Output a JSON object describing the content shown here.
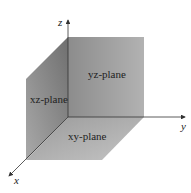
{
  "diagram": {
    "type": "3d-coordinate-planes",
    "axes": {
      "x": {
        "label": "x"
      },
      "y": {
        "label": "y"
      },
      "z": {
        "label": "z"
      }
    },
    "planes": [
      {
        "id": "yz",
        "label": "yz-plane"
      },
      {
        "id": "xz",
        "label": "xz-plane"
      },
      {
        "id": "xy",
        "label": "xy-plane"
      }
    ],
    "colors": {
      "axis": "#333333",
      "yz_plane_start": "#8a8a8a",
      "yz_plane_end": "#b0b0b0",
      "xz_plane_start": "#7a7a7a",
      "xz_plane_end": "#a8a8a8",
      "xy_plane_start": "#a0a0a0",
      "xy_plane_end": "#bdbdbd"
    }
  }
}
